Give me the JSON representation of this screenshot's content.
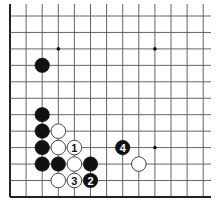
{
  "diagram": {
    "type": "go-board-fragment",
    "colors": {
      "background": "#ffffff",
      "line": "#555555",
      "edge": "#222222",
      "black_stone": "#111111",
      "white_stone": "#ffffff",
      "hoshi": "#111111"
    },
    "grid": {
      "origin_x": 10,
      "origin_y": 16,
      "spacing_x": 16.1,
      "spacing_y": 16.45,
      "cols": 13,
      "rows": 12,
      "open_top": true,
      "open_right": true,
      "left_edge": true,
      "bottom_edge": true
    },
    "hoshi": [
      {
        "col": 3,
        "row": 2
      },
      {
        "col": 9,
        "row": 2
      },
      {
        "col": 9,
        "row": 8
      }
    ],
    "stones": [
      {
        "color": "black",
        "col": 2,
        "row": 3,
        "label": ""
      },
      {
        "color": "black",
        "col": 2,
        "row": 6,
        "label": ""
      },
      {
        "color": "black",
        "col": 2,
        "row": 7,
        "label": ""
      },
      {
        "color": "black",
        "col": 2,
        "row": 8,
        "label": ""
      },
      {
        "color": "black",
        "col": 2,
        "row": 9,
        "label": ""
      },
      {
        "color": "black",
        "col": 3,
        "row": 9,
        "label": ""
      },
      {
        "color": "white",
        "col": 3,
        "row": 7,
        "label": ""
      },
      {
        "color": "white",
        "col": 3,
        "row": 8,
        "label": ""
      },
      {
        "color": "white",
        "col": 4,
        "row": 9,
        "label": ""
      },
      {
        "color": "white",
        "col": 3,
        "row": 10,
        "label": ""
      },
      {
        "color": "white",
        "col": 4,
        "row": 8,
        "label": "1"
      },
      {
        "color": "black",
        "col": 5,
        "row": 10,
        "label": "2"
      },
      {
        "color": "white",
        "col": 4,
        "row": 10,
        "label": "3"
      },
      {
        "color": "black",
        "col": 5,
        "row": 9,
        "label": ""
      },
      {
        "color": "black",
        "col": 7,
        "row": 8,
        "label": "4"
      },
      {
        "color": "white",
        "col": 8,
        "row": 9,
        "label": ""
      }
    ]
  }
}
